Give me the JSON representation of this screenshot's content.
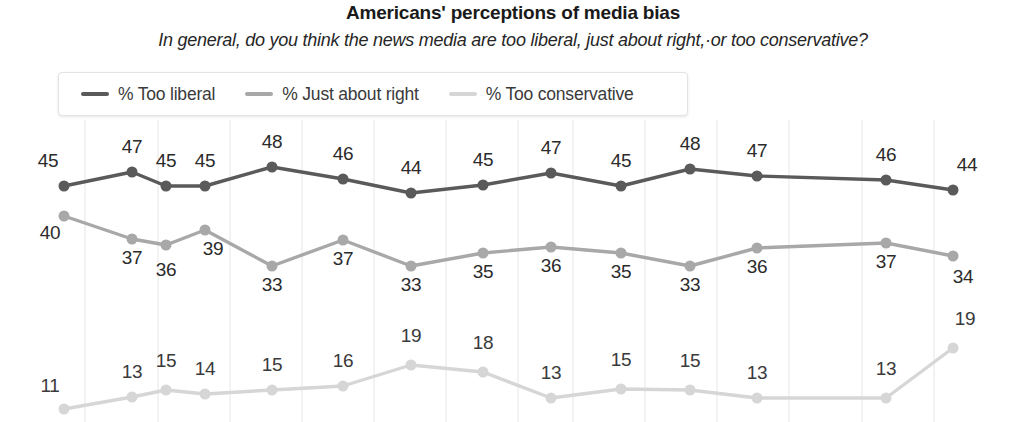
{
  "chart_data": {
    "type": "line",
    "title": "Americans' perceptions of media bias",
    "subtitle": "In general, do you think the news media are too liberal, just about right,·or too conservative?",
    "xlabel": "",
    "ylabel": "",
    "ylim": [
      0,
      55
    ],
    "grid": true,
    "legend_position": "top-left",
    "x": [
      1,
      2,
      3,
      4,
      5,
      6,
      7,
      8,
      9,
      10,
      11,
      12,
      13,
      14
    ],
    "categories": [
      "",
      "",
      "",
      "",
      "",
      "",
      "",
      "",
      "",
      "",
      "",
      "",
      "",
      ""
    ],
    "series": [
      {
        "name": "% Too liberal",
        "color": "#5a5a5a",
        "values": [
          45,
          47,
          45,
          45,
          48,
          46,
          44,
          45,
          47,
          45,
          48,
          47,
          46,
          44
        ]
      },
      {
        "name": "% Just about right",
        "color": "#a8a8a8",
        "values": [
          40,
          37,
          36,
          39,
          33,
          37,
          33,
          35,
          36,
          35,
          33,
          36,
          37,
          34
        ]
      },
      {
        "name": "% Too conservative",
        "color": "#d6d6d6",
        "values": [
          11,
          13,
          15,
          14,
          15,
          16,
          19,
          18,
          13,
          15,
          15,
          13,
          13,
          19
        ]
      }
    ]
  },
  "legend": {
    "items": [
      {
        "label": "% Too liberal",
        "color": "#5a5a5a"
      },
      {
        "label": "% Just about right",
        "color": "#a8a8a8"
      },
      {
        "label": "% Too conservative",
        "color": "#d6d6d6"
      }
    ]
  },
  "layout": {
    "marker_x": [
      64,
      132,
      166,
      205,
      272,
      343,
      411,
      483,
      551,
      621,
      690,
      757,
      886,
      953
    ],
    "gridlines_x": [
      85,
      158,
      230,
      302,
      374,
      446,
      518,
      573,
      645,
      717,
      789,
      862,
      934
    ],
    "grid_top": 120,
    "grid_bottom": 422,
    "series_layout": [
      {
        "key": "liberal",
        "marker_y": [
          186,
          172,
          186,
          186,
          167,
          179,
          193,
          185,
          173,
          186,
          169,
          176,
          180,
          190
        ],
        "label_dy": [
          -22,
          -22,
          -22,
          -22,
          -22,
          -22,
          -22,
          -22,
          -22,
          -22,
          -22,
          -22,
          -22,
          -22
        ],
        "label_dx": [
          -16,
          0,
          0,
          0,
          0,
          0,
          0,
          0,
          0,
          0,
          0,
          0,
          0,
          14
        ],
        "marker_r": 5.5,
        "line_w": 3.4
      },
      {
        "key": "right",
        "marker_y": [
          216,
          239,
          245,
          230,
          266,
          240,
          266,
          253,
          247,
          253,
          266,
          248,
          243,
          256
        ],
        "label_dy": [
          20,
          22,
          28,
          22,
          22,
          22,
          22,
          22,
          22,
          22,
          22,
          22,
          22,
          24
        ],
        "label_dx": [
          -14,
          0,
          0,
          8,
          0,
          0,
          0,
          0,
          0,
          0,
          0,
          0,
          0,
          10
        ],
        "marker_r": 5.5,
        "line_w": 3.4
      },
      {
        "key": "conservative",
        "marker_y": [
          409,
          397,
          390,
          394,
          390,
          386,
          365,
          372,
          398,
          389,
          390,
          398,
          398,
          348
        ],
        "label_dy": [
          -20,
          -22,
          -26,
          -22,
          -22,
          -22,
          -26,
          -26,
          -22,
          -26,
          -26,
          -22,
          -26,
          -26
        ],
        "label_dx": [
          -14,
          0,
          0,
          0,
          0,
          0,
          0,
          0,
          0,
          0,
          0,
          0,
          0,
          12
        ],
        "marker_r": 5.5,
        "line_w": 3.4
      }
    ]
  }
}
